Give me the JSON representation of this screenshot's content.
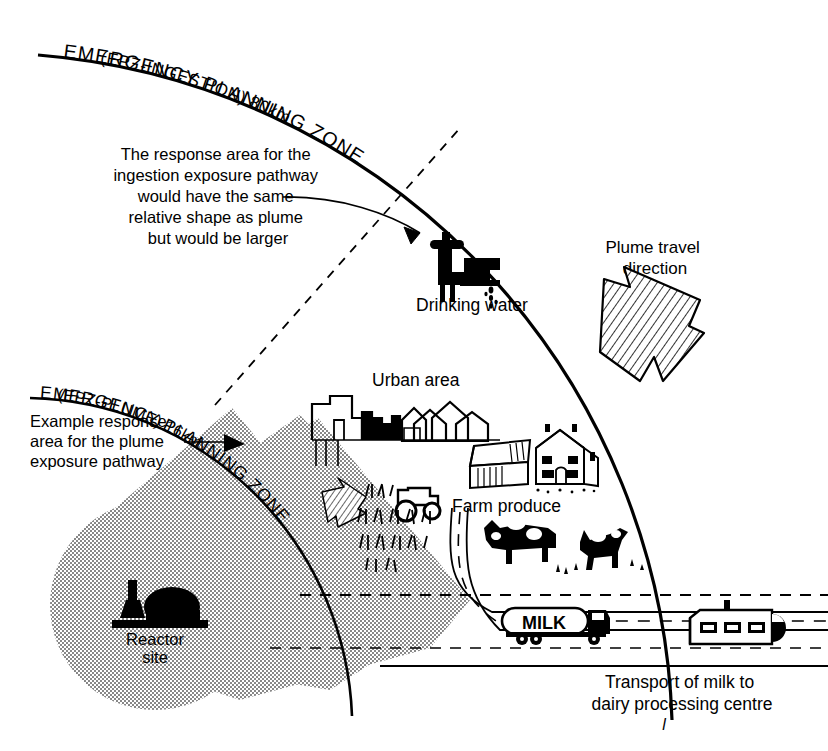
{
  "diagram": {
    "ink_color": "#000000",
    "background": "#ffffff",
    "stipple_color": "#7a7a7a"
  },
  "zones": {
    "outer": {
      "name_line1": "EMERGENCY   PLANNING   ZONE",
      "name_line2": "(EPZ-INGESTION)  80km",
      "radius_label": "80km",
      "id": "EPZ-INGESTION"
    },
    "inner": {
      "name_line1": "EMERGENCY  PLANNING  ZONE",
      "name_line2": "(EPZ-PLUME)  16km",
      "radius_label": "16km",
      "id": "EPZ-PLUME"
    }
  },
  "annotations": {
    "ingestion_note": {
      "lines": [
        "The response area for the",
        "ingestion exposure pathway",
        "would have the same",
        "relative shape as plume",
        "but would be larger"
      ]
    },
    "plume_note": {
      "lines": [
        "Example response",
        "area for the plume",
        "exposure pathway"
      ]
    },
    "plume_travel": {
      "lines": [
        "Plume travel",
        "direction"
      ]
    },
    "milk_transport": {
      "lines": [
        "Transport of milk to",
        "dairy processing centre"
      ]
    },
    "page_mark": "l"
  },
  "features": [
    {
      "id": "drinking-water",
      "label": "Drinking water",
      "icon": "faucet-icon"
    },
    {
      "id": "urban-area",
      "label": "Urban area",
      "icon": "city-skyline-icon"
    },
    {
      "id": "farm-produce",
      "label": "Farm produce",
      "icon": "barn-farmhouse-icon"
    },
    {
      "id": "reactor-site",
      "label_line1": "Reactor",
      "label_line2": "site",
      "icon": "reactor-dome-icon"
    },
    {
      "id": "milk-tanker",
      "label": "MILK",
      "icon": "tanker-truck-icon"
    },
    {
      "id": "dairy-plant",
      "label": "",
      "icon": "factory-icon"
    },
    {
      "id": "tractor",
      "label": "",
      "icon": "tractor-icon"
    },
    {
      "id": "cattle",
      "label": "",
      "icon": "cow-icon"
    },
    {
      "id": "crops",
      "label": "",
      "icon": "crop-field-icon"
    }
  ]
}
